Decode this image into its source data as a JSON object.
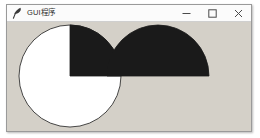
{
  "window": {
    "title": "GUI程序",
    "icon": "feather-icon",
    "background_color": "#d4d0c8",
    "titlebar_color": "#fbfbfb",
    "border_color": "#9a9a9a",
    "controls": [
      {
        "name": "minimize",
        "label": "—",
        "glyph": "minimize-icon"
      },
      {
        "name": "maximize",
        "label": "☐",
        "glyph": "maximize-icon"
      },
      {
        "name": "close",
        "label": "✕",
        "glyph": "close-icon"
      }
    ]
  },
  "canvas": {
    "background_color": "#d4d0c8",
    "outline_color": "#1a1a1a",
    "fill_color": "#1a1a1a",
    "white_color": "#ffffff",
    "shapes": [
      {
        "name": "circle-outline",
        "type": "oval",
        "bbox": [
          12,
          3,
          114,
          105
        ],
        "center": [
          63,
          54
        ],
        "radius": 51,
        "fill": "#ffffff",
        "outline": "#1a1a1a"
      },
      {
        "name": "pieslice-quadrant",
        "type": "pieslice",
        "bbox": [
          12,
          3,
          114,
          105
        ],
        "center": [
          63,
          54
        ],
        "radius": 51,
        "start_angle": 0,
        "extent": 90,
        "fill": "#1a1a1a",
        "outline": "#1a1a1a"
      },
      {
        "name": "pieslice-semicircle",
        "type": "pieslice",
        "bbox": [
          100,
          3,
          202,
          105
        ],
        "center": [
          151,
          54
        ],
        "radius": 51,
        "start_angle": 0,
        "extent": 180,
        "fill": "#1a1a1a",
        "outline": "#1a1a1a"
      }
    ]
  }
}
